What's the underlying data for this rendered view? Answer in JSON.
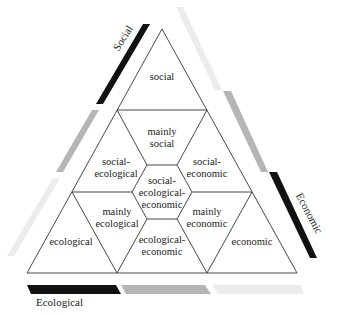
{
  "diagram": {
    "axes": {
      "social": {
        "label": "Social"
      },
      "economic": {
        "label": "Economic"
      },
      "ecological": {
        "label": "Ecological"
      }
    },
    "regions": {
      "social": {
        "line1": "social"
      },
      "mainly_social": {
        "line1": "mainly",
        "line2": "social"
      },
      "social_ecological": {
        "line1": "social-",
        "line2": "ecological"
      },
      "social_economic": {
        "line1": "social-",
        "line2": "economic"
      },
      "center": {
        "line1": "social-",
        "line2": "ecological-",
        "line3": "economic"
      },
      "mainly_ecological": {
        "line1": "mainly",
        "line2": "ecological"
      },
      "mainly_economic": {
        "line1": "mainly",
        "line2": "economic"
      },
      "ecological": {
        "line1": "ecological"
      },
      "ecological_economic": {
        "line1": "ecological-",
        "line2": "economic"
      },
      "economic": {
        "line1": "economic"
      }
    },
    "colors": {
      "dark": "#111111",
      "mid": "#b5b5b5",
      "light": "#ececec",
      "line": "#333333"
    }
  }
}
